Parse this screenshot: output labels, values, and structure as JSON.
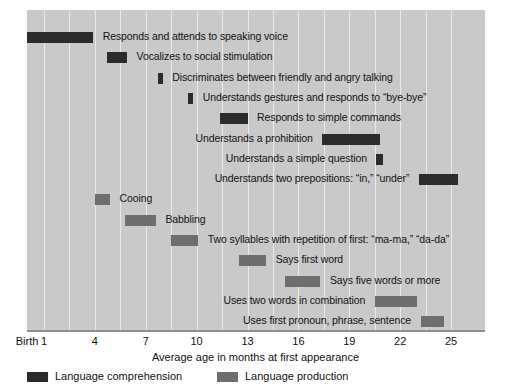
{
  "chart_data": {
    "type": "bar",
    "orientation": "horizontal",
    "title": "",
    "xlabel": "Average age in months at first appearance",
    "ylabel": "",
    "xlim": [
      0,
      27
    ],
    "xticks": [
      {
        "value": 0,
        "label": "Birth"
      },
      {
        "value": 1,
        "label": "1"
      },
      {
        "value": 4,
        "label": "4"
      },
      {
        "value": 7,
        "label": "7"
      },
      {
        "value": 10,
        "label": "10"
      },
      {
        "value": 13,
        "label": "13"
      },
      {
        "value": 16,
        "label": "16"
      },
      {
        "value": 19,
        "label": "19"
      },
      {
        "value": 22,
        "label": "22"
      },
      {
        "value": 25,
        "label": "25"
      }
    ],
    "gridlines": [
      1,
      2.5,
      4,
      5.5,
      7,
      8.5,
      10,
      11.5,
      13,
      14.5,
      16,
      17.5,
      19,
      20.5,
      22,
      23.5,
      25
    ],
    "grid": true,
    "legend_position": "bottom-left",
    "legend": [
      {
        "name": "Language comprehension",
        "color": "#2b2b2b"
      },
      {
        "name": "Language production",
        "color": "#6e6e6e"
      }
    ],
    "colors": {
      "comprehension": "#2b2b2b",
      "production": "#6e6e6e",
      "plot_background": "#c9c9c9",
      "gridline": "#e9e9e9",
      "axis": "#8f8f8f",
      "text": "#111111"
    },
    "bars": [
      {
        "label": "Responds and attends to speaking voice",
        "series": "Language comprehension",
        "start": 0.0,
        "end": 3.9,
        "label_side": "right"
      },
      {
        "label": "Vocalizes to social stimulation",
        "series": "Language comprehension",
        "start": 4.7,
        "end": 5.9,
        "label_side": "right"
      },
      {
        "label": "Discriminates between friendly and angry talking",
        "series": "Language comprehension",
        "start": 7.7,
        "end": 8.0,
        "label_side": "right"
      },
      {
        "label": "Understands gestures and responds to “bye-bye”",
        "series": "Language comprehension",
        "start": 9.5,
        "end": 9.8,
        "label_side": "right"
      },
      {
        "label": "Responds to simple commands",
        "series": "Language comprehension",
        "start": 11.4,
        "end": 13.0,
        "label_side": "right"
      },
      {
        "label": "Understands a prohibition",
        "series": "Language comprehension",
        "start": 17.4,
        "end": 20.8,
        "label_side": "left"
      },
      {
        "label": "Understands a simple question",
        "series": "Language comprehension",
        "start": 20.6,
        "end": 21.0,
        "label_side": "left"
      },
      {
        "label": "Understands two prepositions: “in,” “under”",
        "series": "Language comprehension",
        "start": 23.1,
        "end": 25.4,
        "label_side": "left"
      },
      {
        "label": "Cooing",
        "series": "Language production",
        "start": 4.0,
        "end": 4.9,
        "label_side": "right"
      },
      {
        "label": "Babbling",
        "series": "Language production",
        "start": 5.8,
        "end": 7.6,
        "label_side": "right"
      },
      {
        "label": "Two syllables with repetition of first: “ma-ma,” “da-da”",
        "series": "Language production",
        "start": 8.5,
        "end": 10.1,
        "label_side": "right"
      },
      {
        "label": "Says first word",
        "series": "Language production",
        "start": 12.5,
        "end": 14.1,
        "label_side": "right"
      },
      {
        "label": "Says five words or more",
        "series": "Language production",
        "start": 15.2,
        "end": 17.3,
        "label_side": "right"
      },
      {
        "label": "Uses two words in combination",
        "series": "Language production",
        "start": 20.5,
        "end": 23.0,
        "label_side": "left"
      },
      {
        "label": "Uses first pronoun, phrase, sentence",
        "series": "Language production",
        "start": 23.2,
        "end": 24.6,
        "label_side": "left"
      }
    ]
  },
  "axis": {
    "xlabel": "Average age in months at first appearance"
  },
  "legend": {
    "comprehension_label": "Language comprehension",
    "production_label": "Language production"
  }
}
